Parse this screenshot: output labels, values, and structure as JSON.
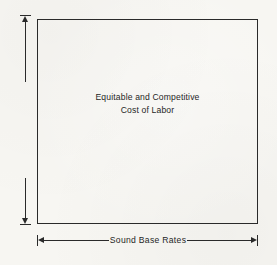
{
  "diagram": {
    "title": "Equitable and Competitive Cost of Labor",
    "type": "labeled-rectangle-with-dimension-arrows",
    "box": {
      "label_line_1": "Equitable and Competitive",
      "label_line_2": "Cost of Labor",
      "label_full": "Equitable and Competitive\nCost of Labor"
    },
    "vertical_axis": {
      "label": "Fair Labor Standards",
      "arrow_style": "double-headed",
      "orientation": "vertical",
      "reading_direction": "bottom-to-top"
    },
    "horizontal_axis": {
      "label": "Sound Base Rates",
      "arrow_style": "double-headed",
      "orientation": "horizontal",
      "reading_direction": "left-to-right"
    },
    "colors": {
      "background": "#f7f6f2",
      "stroke": "#2a2a2a",
      "text": "#1f1f1f"
    }
  }
}
